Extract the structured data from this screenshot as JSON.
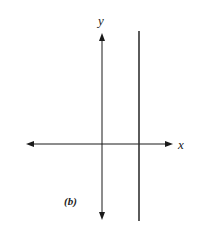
{
  "figure": {
    "panel_label": "(b)",
    "x_axis_label": "x",
    "y_axis_label": "y",
    "colors": {
      "axis": "#1a1a1a",
      "line": "#333333",
      "background": "#ffffff"
    }
  }
}
